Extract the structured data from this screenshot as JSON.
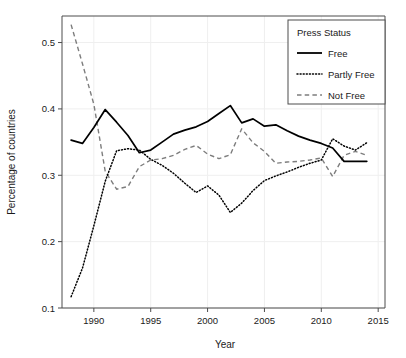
{
  "chart_data": {
    "type": "line",
    "title": "",
    "xlabel": "Year",
    "ylabel": "Percentage of countries",
    "xlim": [
      1987.2,
      2015.6
    ],
    "ylim": [
      0.1,
      0.54
    ],
    "xticks": [
      "1990",
      "1995",
      "2000",
      "2005",
      "2010",
      "2015"
    ],
    "xtick_values": [
      1990,
      1995,
      2000,
      2005,
      2010,
      2015
    ],
    "yticks": [
      "0.1",
      "0.2",
      "0.3",
      "0.4",
      "0.5"
    ],
    "ytick_values": [
      0.1,
      0.2,
      0.3,
      0.4,
      0.5
    ],
    "grid": true,
    "legend_position": "top-right",
    "legend_title": "Press Status",
    "x": [
      1988,
      1989,
      1990,
      1991,
      1992,
      1993,
      1994,
      1995,
      1996,
      1997,
      1998,
      1999,
      2000,
      2001,
      2002,
      2003,
      2004,
      2005,
      2006,
      2007,
      2008,
      2009,
      2010,
      2011,
      2012,
      2013,
      2014
    ],
    "series": [
      {
        "name": "Free",
        "style": "solid",
        "color": "#000000",
        "values": [
          0.353,
          0.348,
          0.372,
          0.399,
          0.38,
          0.36,
          0.334,
          0.338,
          0.35,
          0.362,
          0.368,
          0.373,
          0.381,
          0.393,
          0.405,
          0.379,
          0.385,
          0.374,
          0.376,
          0.367,
          0.359,
          0.353,
          0.348,
          0.341,
          0.321,
          0.321,
          0.321
        ]
      },
      {
        "name": "Partly Free",
        "style": "dotted",
        "color": "#000000",
        "values": [
          0.117,
          0.16,
          0.224,
          0.291,
          0.337,
          0.34,
          0.338,
          0.324,
          0.315,
          0.303,
          0.288,
          0.274,
          0.284,
          0.27,
          0.244,
          0.258,
          0.277,
          0.292,
          0.299,
          0.305,
          0.312,
          0.318,
          0.323,
          0.355,
          0.344,
          0.338,
          0.349
        ]
      },
      {
        "name": "Not Free",
        "style": "dashed",
        "color": "#7d7d7d",
        "values": [
          0.527,
          0.468,
          0.407,
          0.306,
          0.279,
          0.283,
          0.313,
          0.323,
          0.325,
          0.33,
          0.339,
          0.345,
          0.332,
          0.325,
          0.331,
          0.37,
          0.349,
          0.336,
          0.318,
          0.32,
          0.321,
          0.323,
          0.326,
          0.298,
          0.33,
          0.336,
          0.33
        ]
      }
    ]
  },
  "legend": {
    "title": "Press Status",
    "items": [
      {
        "label": "Free",
        "style": "solid"
      },
      {
        "label": "Partly Free",
        "style": "dotted"
      },
      {
        "label": "Not Free",
        "style": "dashed"
      }
    ]
  },
  "axes": {
    "x_title": "Year",
    "y_title": "Percentage of countries"
  }
}
